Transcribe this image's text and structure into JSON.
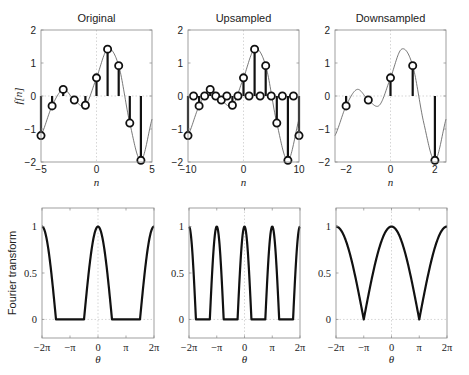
{
  "chart_data": [
    {
      "type": "stem",
      "id": "original",
      "title": "Original",
      "xlabel": "n",
      "ylabel": "f[n]",
      "xlim": [
        -5,
        5
      ],
      "ylim": [
        -2,
        2
      ],
      "xticks": [
        -5,
        0,
        5
      ],
      "yticks": [
        -2,
        -1,
        0,
        1,
        2
      ],
      "xtick_labels": [
        "−5",
        "0",
        "5"
      ],
      "ytick_labels": [
        "−2",
        "−1",
        "0",
        "1",
        "2"
      ],
      "n": [
        -5,
        -4,
        -3,
        -2,
        -1,
        0,
        1,
        2,
        3,
        4
      ],
      "values": [
        -1.2,
        -0.3,
        0.2,
        -0.12,
        -0.28,
        0.55,
        1.42,
        0.92,
        -0.82,
        -1.95
      ],
      "continuous_curve": true,
      "curve_time_scale": 1
    },
    {
      "type": "stem",
      "id": "upsampled",
      "title": "Upsampled",
      "xlabel": "n",
      "ylabel": "",
      "xlim": [
        -10,
        10
      ],
      "ylim": [
        -2,
        2
      ],
      "xticks": [
        -10,
        0,
        10
      ],
      "yticks": [
        -2,
        -1,
        0,
        1,
        2
      ],
      "xtick_labels": [
        "−10",
        "0",
        "10"
      ],
      "ytick_labels": [
        "−2",
        "−1",
        "0",
        "1",
        "2"
      ],
      "n": [
        -10,
        -9,
        -8,
        -7,
        -6,
        -5,
        -4,
        -3,
        -2,
        -1,
        0,
        1,
        2,
        3,
        4,
        5,
        6,
        7,
        8,
        9,
        10
      ],
      "values": [
        -1.2,
        0,
        -0.3,
        0,
        0.2,
        0,
        -0.12,
        0,
        -0.28,
        0,
        0.55,
        0,
        1.42,
        0,
        0.92,
        0,
        -0.82,
        0,
        -1.95,
        0,
        -1.2
      ],
      "continuous_curve": true,
      "curve_time_scale": 2
    },
    {
      "type": "stem",
      "id": "downsampled",
      "title": "Downsampled",
      "xlabel": "n",
      "ylabel": "",
      "xlim": [
        -2.5,
        2.5
      ],
      "ylim": [
        -2,
        2
      ],
      "xticks": [
        -2,
        0,
        2
      ],
      "yticks": [
        -2,
        -1,
        0,
        1,
        2
      ],
      "xtick_labels": [
        "−2",
        "0",
        "2"
      ],
      "ytick_labels": [
        "−2",
        "−1",
        "0",
        "1",
        "2"
      ],
      "n": [
        -2,
        -1,
        0,
        1,
        2
      ],
      "values": [
        -0.3,
        -0.12,
        0.55,
        0.92,
        -1.95
      ],
      "continuous_curve": true,
      "curve_time_scale": 0.5
    },
    {
      "type": "line",
      "id": "ft-original",
      "xlabel": "θ",
      "ylabel": "Fourier transform",
      "xlim_pi": [
        -2,
        2
      ],
      "ylim": [
        -0.2,
        1.2
      ],
      "xticks_pi": [
        -2,
        -1,
        0,
        1,
        2
      ],
      "xtick_labels": [
        "−2π",
        "−π",
        "0",
        "π",
        "2π"
      ],
      "yticks": [
        0,
        0.5,
        1
      ],
      "ytick_labels": [
        "0",
        "0.5",
        "1"
      ],
      "description": "Periodic (2π) lowpass: peak 1 at 0 and ±2π, zero for π/2 < |θ| < 3π/2",
      "period_pi": 2,
      "support_halfwidth_pi": 0.5
    },
    {
      "type": "line",
      "id": "ft-upsampled",
      "xlabel": "θ",
      "ylabel": "",
      "xlim_pi": [
        -2,
        2
      ],
      "ylim": [
        -0.2,
        1.2
      ],
      "xticks_pi": [
        -2,
        -1,
        0,
        1,
        2
      ],
      "xtick_labels": [
        "−2π",
        "−π",
        "0",
        "π",
        "2π"
      ],
      "yticks": [
        0,
        0.5,
        1
      ],
      "ytick_labels": [
        "0",
        "0.5",
        "1"
      ],
      "description": "Spectrum compressed by 2: peaks at 0, ±π, ±2π",
      "period_pi": 1,
      "support_halfwidth_pi": 0.25
    },
    {
      "type": "line",
      "id": "ft-downsampled",
      "xlabel": "θ",
      "ylabel": "",
      "xlim_pi": [
        -2,
        2
      ],
      "ylim": [
        -0.2,
        1.2
      ],
      "xticks_pi": [
        -2,
        -1,
        0,
        1,
        2
      ],
      "xtick_labels": [
        "−2π",
        "−π",
        "0",
        "π",
        "2π"
      ],
      "yticks": [
        0,
        0.5,
        1
      ],
      "ytick_labels": [
        "0",
        "0.5",
        "1"
      ],
      "description": "Spectrum stretched by 2: peaks at 0, ±2π, zeros at ±π",
      "period_pi": 2,
      "support_halfwidth_pi": 1
    }
  ]
}
